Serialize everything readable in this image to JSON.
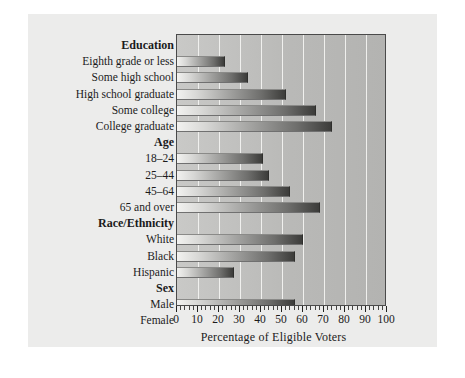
{
  "figure": {
    "background_color": "#ffffff",
    "panel_color": "#ececeb",
    "plot_fill_color": "#bcbcba",
    "gridline_color": "#f2f2f0",
    "bar_gradient_from": "#f2f2f0",
    "bar_gradient_to": "#3c3c3a",
    "axis_color": "#4a4a4a"
  },
  "chart_data": {
    "type": "bar",
    "orientation": "horizontal",
    "title": "",
    "xlabel": "Percentage of Eligible Voters",
    "ylabel": "",
    "xlim": [
      0,
      100
    ],
    "xticks": [
      0,
      10,
      20,
      30,
      40,
      50,
      60,
      70,
      80,
      90,
      100
    ],
    "xtick_labels": [
      "0",
      "10",
      "20",
      "30",
      "40",
      "50",
      "60",
      "70",
      "80",
      "90",
      "100"
    ],
    "grid": "vertical",
    "legend": "none",
    "minor_tick_interval": 2,
    "groups": [
      {
        "name": "Education",
        "categories": [
          "Eighth grade or less",
          "Some high school",
          "High school graduate",
          "Some college",
          "College graduate"
        ],
        "values": [
          23,
          34,
          52,
          66,
          74
        ]
      },
      {
        "name": "Age",
        "categories": [
          "18–24",
          "25–44",
          "45–64",
          "65 and over"
        ],
        "values": [
          41,
          44,
          54,
          68
        ]
      },
      {
        "name": "Race/Ethnicity",
        "categories": [
          "White",
          "Black",
          "Hispanic"
        ],
        "values": [
          60,
          56,
          27
        ]
      },
      {
        "name": "Sex",
        "categories": [
          "Male",
          "Female"
        ],
        "values": [
          56,
          60
        ]
      }
    ]
  }
}
